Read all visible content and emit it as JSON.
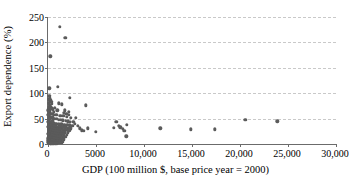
{
  "chart_data": {
    "type": "scatter",
    "title": "",
    "xlabel": "GDP (100 million $, base price year = 2000)",
    "ylabel": "Export dependence (%)",
    "xlim": [
      0,
      30000
    ],
    "ylim": [
      0,
      250
    ],
    "xticks": [
      0,
      5000,
      10000,
      15000,
      20000,
      25000,
      30000
    ],
    "xtick_labels": [
      "0",
      "5000",
      "10,000",
      "15,000",
      "20,000",
      "25,000",
      "30,000"
    ],
    "yticks": [
      0,
      50,
      100,
      150,
      200,
      250
    ],
    "ytick_labels": [
      "0",
      "50",
      "100",
      "150",
      "200",
      "250"
    ],
    "grid": "horizontal-dashed",
    "legend": "none",
    "marker_color": "#5b5b5b",
    "axis_color": "#6b6b6b",
    "gridline_color": "#c9c9c9",
    "series": [
      {
        "name": "Countries",
        "points": [
          [
            1250,
            231
          ],
          [
            1800,
            209
          ],
          [
            250,
            173
          ],
          [
            120,
            110
          ],
          [
            1050,
            112
          ],
          [
            2300,
            91
          ],
          [
            3950,
            76
          ],
          [
            150,
            95
          ],
          [
            200,
            90
          ],
          [
            230,
            86
          ],
          [
            330,
            83
          ],
          [
            390,
            79
          ],
          [
            1150,
            80
          ],
          [
            1450,
            78
          ],
          [
            170,
            74
          ],
          [
            280,
            72
          ],
          [
            360,
            70
          ],
          [
            520,
            68
          ],
          [
            980,
            66
          ],
          [
            1750,
            66
          ],
          [
            2150,
            63
          ],
          [
            140,
            64
          ],
          [
            210,
            62
          ],
          [
            300,
            60
          ],
          [
            440,
            59
          ],
          [
            620,
            58
          ],
          [
            860,
            57
          ],
          [
            1300,
            56
          ],
          [
            1600,
            55
          ],
          [
            1950,
            54
          ],
          [
            2400,
            52
          ],
          [
            2900,
            52
          ],
          [
            110,
            56
          ],
          [
            160,
            54
          ],
          [
            240,
            53
          ],
          [
            320,
            52
          ],
          [
            410,
            51
          ],
          [
            560,
            50
          ],
          [
            700,
            49
          ],
          [
            900,
            49
          ],
          [
            1100,
            48
          ],
          [
            1350,
            48
          ],
          [
            1550,
            47
          ],
          [
            1850,
            46
          ],
          [
            2050,
            45
          ],
          [
            2250,
            44
          ],
          [
            20550,
            48
          ],
          [
            23900,
            45
          ],
          [
            7100,
            44
          ],
          [
            8200,
            38
          ],
          [
            7350,
            36
          ],
          [
            7550,
            33
          ],
          [
            7800,
            30
          ],
          [
            7950,
            26
          ],
          [
            8150,
            15
          ],
          [
            6850,
            32
          ],
          [
            11700,
            31
          ],
          [
            14900,
            29
          ],
          [
            17350,
            29
          ],
          [
            3500,
            27
          ],
          [
            3700,
            26
          ],
          [
            4150,
            31
          ],
          [
            4950,
            24
          ],
          [
            130,
            44
          ],
          [
            190,
            43
          ],
          [
            260,
            42
          ],
          [
            350,
            42
          ],
          [
            470,
            41
          ],
          [
            600,
            41
          ],
          [
            760,
            40
          ],
          [
            940,
            40
          ],
          [
            1150,
            39
          ],
          [
            1400,
            39
          ],
          [
            1700,
            38
          ],
          [
            2000,
            38
          ],
          [
            2300,
            37
          ],
          [
            2550,
            36
          ],
          [
            100,
            40
          ],
          [
            150,
            39
          ],
          [
            220,
            38
          ],
          [
            300,
            37
          ],
          [
            380,
            37
          ],
          [
            500,
            36
          ],
          [
            650,
            35
          ],
          [
            820,
            35
          ],
          [
            1000,
            34
          ],
          [
            1250,
            34
          ],
          [
            1500,
            33
          ],
          [
            1800,
            33
          ],
          [
            2100,
            32
          ],
          [
            2400,
            31
          ],
          [
            90,
            35
          ],
          [
            140,
            34
          ],
          [
            200,
            33
          ],
          [
            270,
            33
          ],
          [
            350,
            32
          ],
          [
            450,
            31
          ],
          [
            580,
            31
          ],
          [
            730,
            30
          ],
          [
            890,
            30
          ],
          [
            1080,
            29
          ],
          [
            1300,
            29
          ],
          [
            1580,
            28
          ],
          [
            1900,
            28
          ],
          [
            2200,
            27
          ],
          [
            80,
            30
          ],
          [
            125,
            29
          ],
          [
            180,
            29
          ],
          [
            250,
            28
          ],
          [
            330,
            27
          ],
          [
            420,
            27
          ],
          [
            540,
            26
          ],
          [
            680,
            26
          ],
          [
            840,
            25
          ],
          [
            1020,
            25
          ],
          [
            1230,
            24
          ],
          [
            1480,
            24
          ],
          [
            1750,
            23
          ],
          [
            2050,
            23
          ],
          [
            70,
            26
          ],
          [
            110,
            25
          ],
          [
            165,
            24
          ],
          [
            225,
            24
          ],
          [
            300,
            23
          ],
          [
            390,
            22
          ],
          [
            500,
            22
          ],
          [
            630,
            21
          ],
          [
            780,
            21
          ],
          [
            950,
            20
          ],
          [
            1150,
            20
          ],
          [
            1380,
            19
          ],
          [
            1650,
            19
          ],
          [
            1950,
            18
          ],
          [
            60,
            21
          ],
          [
            100,
            20
          ],
          [
            150,
            20
          ],
          [
            210,
            19
          ],
          [
            280,
            18
          ],
          [
            360,
            18
          ],
          [
            460,
            17
          ],
          [
            580,
            17
          ],
          [
            720,
            16
          ],
          [
            880,
            16
          ],
          [
            1060,
            15
          ],
          [
            1270,
            15
          ],
          [
            1520,
            14
          ],
          [
            1800,
            14
          ],
          [
            55,
            16
          ],
          [
            90,
            15
          ],
          [
            135,
            15
          ],
          [
            190,
            14
          ],
          [
            255,
            13
          ],
          [
            330,
            13
          ],
          [
            420,
            12
          ],
          [
            530,
            12
          ],
          [
            660,
            11
          ],
          [
            810,
            11
          ],
          [
            980,
            10
          ],
          [
            1180,
            10
          ],
          [
            1400,
            9
          ],
          [
            1660,
            9
          ],
          [
            50,
            11
          ],
          [
            80,
            10
          ],
          [
            120,
            10
          ],
          [
            170,
            9
          ],
          [
            230,
            9
          ],
          [
            300,
            8
          ],
          [
            380,
            8
          ],
          [
            480,
            7
          ],
          [
            600,
            7
          ],
          [
            740,
            6
          ],
          [
            900,
            6
          ],
          [
            1080,
            5
          ],
          [
            1290,
            5
          ],
          [
            1530,
            4
          ],
          [
            45,
            7
          ],
          [
            70,
            6
          ],
          [
            105,
            6
          ],
          [
            150,
            5
          ],
          [
            205,
            5
          ],
          [
            270,
            4
          ],
          [
            345,
            4
          ],
          [
            435,
            3
          ],
          [
            545,
            3
          ],
          [
            670,
            3
          ],
          [
            820,
            2
          ],
          [
            990,
            2
          ],
          [
            1190,
            2
          ],
          [
            1420,
            2
          ],
          [
            40,
            3
          ],
          [
            65,
            3
          ],
          [
            95,
            2
          ],
          [
            135,
            2
          ],
          [
            185,
            2
          ],
          [
            245,
            1
          ],
          [
            315,
            1
          ],
          [
            400,
            1
          ],
          [
            500,
            1
          ],
          [
            620,
            1
          ],
          [
            760,
            1
          ],
          [
            920,
            1
          ],
          [
            60,
            48
          ],
          [
            85,
            52
          ],
          [
            115,
            60
          ],
          [
            145,
            68
          ],
          [
            175,
            76
          ],
          [
            205,
            84
          ],
          [
            95,
            46
          ],
          [
            125,
            50
          ],
          [
            35,
            20
          ],
          [
            38,
            34
          ],
          [
            42,
            44
          ],
          [
            48,
            58
          ],
          [
            52,
            66
          ],
          [
            58,
            72
          ],
          [
            64,
            80
          ],
          [
            72,
            88
          ],
          [
            2650,
            44
          ],
          [
            2800,
            40
          ],
          [
            3100,
            36
          ],
          [
            3300,
            31
          ],
          [
            1900,
            60
          ],
          [
            2150,
            57
          ],
          [
            1650,
            62
          ],
          [
            430,
            46
          ],
          [
            510,
            54
          ],
          [
            590,
            63
          ],
          [
            690,
            71
          ]
        ]
      }
    ]
  }
}
